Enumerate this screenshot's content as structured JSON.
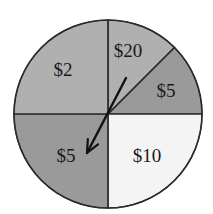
{
  "figure": {
    "kind": "spinner-wheel",
    "background_color": "#ffffff",
    "outline_color": "#2b2b2b",
    "pointer_color": "#111111"
  },
  "chart_data": {
    "type": "pie",
    "title": "",
    "subtitle": "",
    "xlabel": "",
    "ylabel": "",
    "legend": "none",
    "grid": false,
    "center_x": 108,
    "center_y": 114,
    "radius": 94,
    "labels": [
      "$20",
      "$5",
      "$10",
      "$5",
      "$2"
    ],
    "values": [
      45,
      45,
      90,
      90,
      90
    ],
    "units": "degrees",
    "categories": [
      "$20",
      "$5",
      "$10",
      "$5",
      "$2"
    ],
    "slices": [
      {
        "label": "$20",
        "start_angle": 45,
        "end_angle": 90,
        "sweep": 45,
        "color": "#b0b0b0",
        "label_x": 128,
        "label_y": 53
      },
      {
        "label": "$5",
        "start_angle": 0,
        "end_angle": 45,
        "sweep": 45,
        "color": "#9a9a9a",
        "label_x": 166,
        "label_y": 93
      },
      {
        "label": "$10",
        "start_angle": 270,
        "end_angle": 360,
        "sweep": 90,
        "color": "#f4f4f4",
        "label_x": 147,
        "label_y": 158
      },
      {
        "label": "$5",
        "start_angle": 180,
        "end_angle": 270,
        "sweep": 90,
        "color": "#9a9a9a",
        "label_x": 66,
        "label_y": 158
      },
      {
        "label": "$2",
        "start_angle": 90,
        "end_angle": 180,
        "sweep": 90,
        "color": "#b0b0b0",
        "label_x": 63,
        "label_y": 72
      }
    ],
    "pointer": {
      "tail_x": 126,
      "tail_y": 78,
      "tip_x": 87,
      "tip_y": 153,
      "points_at": "$5"
    }
  }
}
